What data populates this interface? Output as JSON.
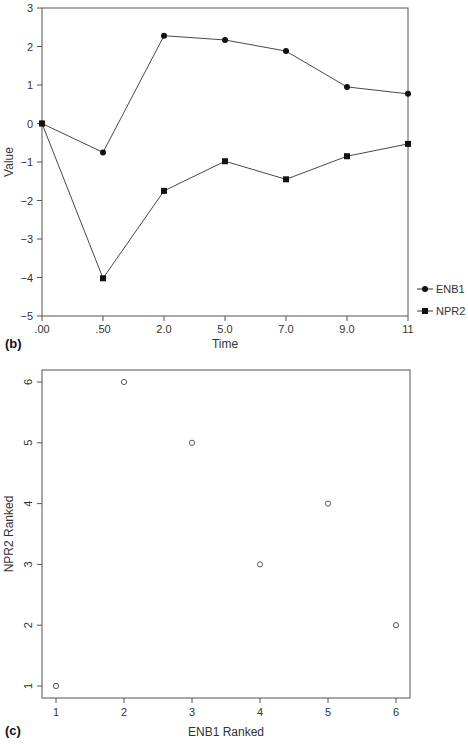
{
  "chart_data": [
    {
      "type": "line",
      "panel_label": "(b)",
      "title": "",
      "xlabel": "Time",
      "ylabel": "Value",
      "categories": [
        ".00",
        ".50",
        "2.0",
        "5.0",
        "7.0",
        "9.0",
        "11"
      ],
      "ylim": [
        -5,
        3
      ],
      "yticks": [
        "3",
        "2",
        "1",
        "0",
        "-1",
        "-2",
        "-3",
        "-4",
        "-5"
      ],
      "grid": false,
      "legend_position": "right-bottom",
      "series": [
        {
          "name": "ENB1",
          "marker": "circle",
          "values": [
            0,
            -0.75,
            2.28,
            2.17,
            1.88,
            0.95,
            0.77
          ]
        },
        {
          "name": "NPR2",
          "marker": "square",
          "values": [
            0,
            -4.02,
            -1.75,
            -0.98,
            -1.45,
            -0.85,
            -0.53
          ]
        }
      ]
    },
    {
      "type": "scatter",
      "panel_label": "(c)",
      "title": "",
      "xlabel": "ENB1 Ranked",
      "ylabel": "NPR2 Ranked",
      "xticks": [
        "1",
        "2",
        "3",
        "4",
        "5",
        "6"
      ],
      "yticks": [
        "1",
        "2",
        "3",
        "4",
        "5",
        "6"
      ],
      "xlim": [
        0.8,
        6.2
      ],
      "ylim": [
        0.8,
        6.2
      ],
      "grid": false,
      "marker": "open-circle",
      "points": [
        {
          "x": 1,
          "y": 1
        },
        {
          "x": 2,
          "y": 6
        },
        {
          "x": 3,
          "y": 5
        },
        {
          "x": 4,
          "y": 3
        },
        {
          "x": 5,
          "y": 4
        },
        {
          "x": 6,
          "y": 2
        }
      ]
    }
  ]
}
